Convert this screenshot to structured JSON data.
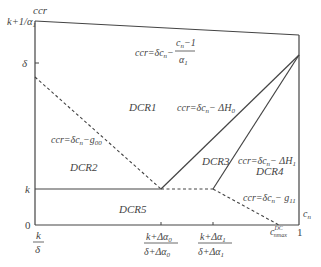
{
  "diagram": {
    "axes": {
      "y_label": "ccr",
      "x_label": "c_n",
      "y_ticks": [
        {
          "label": "k+1/α1",
          "y": 21
        },
        {
          "label": "δ",
          "y": 63
        },
        {
          "label": "k",
          "y": 189
        },
        {
          "label": "0",
          "y": 225
        }
      ],
      "x_ticks": [
        {
          "label_num": "k",
          "label_den": "δ",
          "x": 35
        },
        {
          "label_num": "k+Δα0",
          "label_den": "δ+Δα0",
          "x": 161
        },
        {
          "label_num": "k+Δα1",
          "label_den": "δ+Δα1",
          "x": 213
        },
        {
          "label": "c_nmax^DC",
          "x": 279
        },
        {
          "label": "1",
          "x": 299
        }
      ]
    },
    "regions": [
      "DCR1",
      "DCR2",
      "DCR3",
      "DCR4",
      "DCR5"
    ],
    "equations": {
      "top": "ccr=δc_n − (c_n−1)/α1",
      "h0": "ccr=δc_n − ΔH0",
      "h1": "ccr=δc_n − ΔH1",
      "g00": "ccr=δc_n − g00",
      "g11": "ccr=δc_n − g11"
    }
  }
}
